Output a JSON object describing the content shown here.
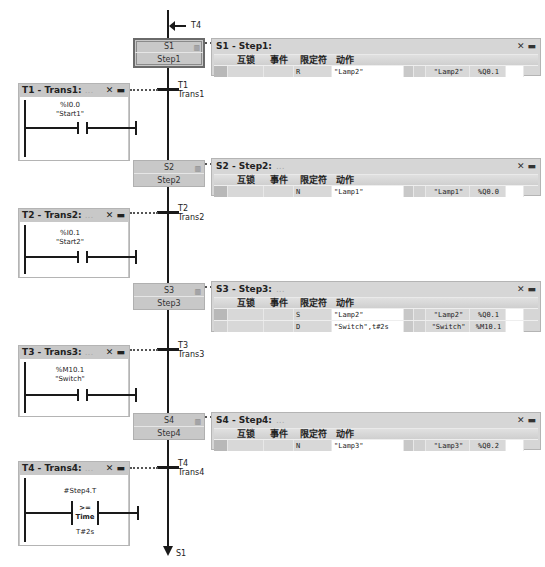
{
  "chain": {
    "top_jump_label": "T4",
    "bottom_jump_label": "S1"
  },
  "steps": [
    {
      "num": "S1",
      "name": "Step1",
      "initial": true
    },
    {
      "num": "S2",
      "name": "Step2",
      "initial": false
    },
    {
      "num": "S3",
      "name": "Step3",
      "initial": false
    },
    {
      "num": "S4",
      "name": "Step4",
      "initial": false
    }
  ],
  "transitions": [
    {
      "num": "T1",
      "name": "Trans1"
    },
    {
      "num": "T2",
      "name": "Trans2"
    },
    {
      "num": "T3",
      "name": "Trans3"
    },
    {
      "num": "T4",
      "name": "Trans4"
    }
  ],
  "action_table_headers": {
    "interlock": "互锁",
    "event": "事件",
    "qualifier": "限定符",
    "action": "动作"
  },
  "panel_controls": {
    "close": "✕",
    "minimize": "▬"
  },
  "step_panels": [
    {
      "title": "S1 - Step1:",
      "comment": "",
      "rows": [
        {
          "qualifier": "R",
          "action": "\"Lamp2\"",
          "tag": "\"Lamp2\"",
          "address": "%Q0.1"
        }
      ]
    },
    {
      "title": "S2 - Step2:",
      "comment": "...",
      "rows": [
        {
          "qualifier": "N",
          "action": "\"Lamp1\"",
          "tag": "\"Lamp1\"",
          "address": "%Q0.0"
        }
      ]
    },
    {
      "title": "S3 - Step3:",
      "comment": "...",
      "rows": [
        {
          "qualifier": "S",
          "action": "\"Lamp2\"",
          "tag": "\"Lamp2\"",
          "address": "%Q0.1"
        },
        {
          "qualifier": "D",
          "action": "\"Switch\",t#2s",
          "tag": "\"Switch\"",
          "address": "%M10.1"
        }
      ]
    },
    {
      "title": "S4 - Step4:",
      "comment": "...",
      "rows": [
        {
          "qualifier": "N",
          "action": "\"Lamp3\"",
          "tag": "\"Lamp3\"",
          "address": "%Q0.2"
        }
      ]
    }
  ],
  "transition_panels": [
    {
      "title": "T1 - Trans1:",
      "comment": "...",
      "contact_address": "%I0.0",
      "contact_tag": "\"Start1\""
    },
    {
      "title": "T2 - Trans2:",
      "comment": "...",
      "contact_address": "%I0.1",
      "contact_tag": "\"Start2\""
    },
    {
      "title": "T3 - Trans3:",
      "comment": "...",
      "contact_address": "%M10.1",
      "contact_tag": "\"Switch\""
    },
    {
      "title": "T4 - Trans4:",
      "comment": "...",
      "compare_operand1": "#Step4.T",
      "compare_op": ">=",
      "compare_type": "Time",
      "compare_operand2": "T#2s"
    }
  ]
}
